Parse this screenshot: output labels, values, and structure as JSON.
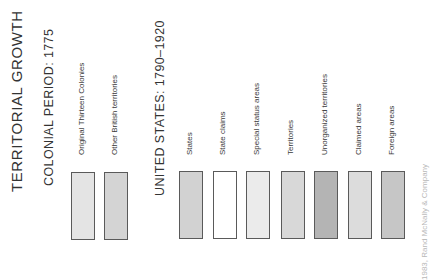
{
  "legend": {
    "title": "TERRITORIAL GROWTH",
    "sections": [
      {
        "heading": "COLONIAL PERIOD: 1775",
        "items": [
          {
            "label": "Original Thirteen Colonies",
            "color": "#e4e4e4"
          },
          {
            "label": "Other British territories",
            "color": "#d4d4d4"
          }
        ]
      },
      {
        "heading": "UNITED STATES: 1790–1920",
        "items": [
          {
            "label": "States",
            "color": "#d2d2d2"
          },
          {
            "label": "State claims",
            "color": "#ffffff"
          },
          {
            "label": "Special status areas",
            "color": "#ebebeb"
          },
          {
            "label": "Territories",
            "color": "#d8d8d8"
          },
          {
            "label": "Unorganized territories",
            "color": "#b4b4b4"
          },
          {
            "label": "Claimed areas",
            "color": "#dcdcdc"
          },
          {
            "label": "Foreign areas",
            "color": "#c6c6c6"
          }
        ]
      }
    ],
    "credit": "1983, Rand McNally & Company"
  }
}
